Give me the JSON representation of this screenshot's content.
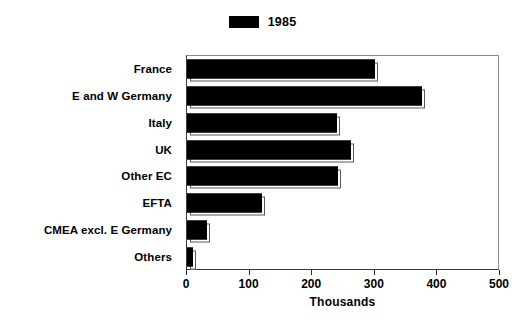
{
  "chart_data": {
    "type": "bar",
    "orientation": "horizontal",
    "title": "",
    "subtitle": "",
    "xlabel": "Thousands",
    "ylabel": "",
    "xlim": [
      0,
      500
    ],
    "xticks": [
      0,
      100,
      200,
      300,
      400,
      500
    ],
    "xtick_labels": [
      "0",
      "100",
      "200",
      "300",
      "400",
      "500"
    ],
    "grid": false,
    "legend_position": "top-center",
    "categories": [
      "France",
      "E and W Germany",
      "Italy",
      "UK",
      "Other EC",
      "EFTA",
      "CMEA excl. E Germany",
      "Others"
    ],
    "series": [
      {
        "name": "1985",
        "color": "#000000",
        "values": [
          300,
          375,
          240,
          262,
          242,
          120,
          32,
          9
        ]
      }
    ]
  },
  "legend": {
    "entries": [
      {
        "label": "1985",
        "color": "#000000",
        "swatch_name": "legend-swatch-1985"
      }
    ]
  },
  "axes": {
    "x_title": "Thousands",
    "x_tick_labels": [
      "0",
      "100",
      "200",
      "300",
      "400",
      "500"
    ],
    "y_tick_labels": [
      "France",
      "E and W Germany",
      "Italy",
      "UK",
      "Other EC",
      "EFTA",
      "CMEA excl. E Germany",
      "Others"
    ]
  },
  "colors": {
    "bar_fill": "#000000",
    "bar_outline": "#000000",
    "plot_background": "#ffffff",
    "axis_line": "#2a2a2a",
    "text": "#000000"
  }
}
